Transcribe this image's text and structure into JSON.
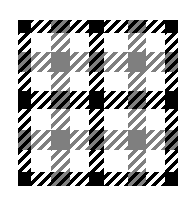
{
  "image": {
    "description": "Black, gray and white gingham / tartan check pattern square with diagonal hatched stripes",
    "colors": {
      "black": "#000000",
      "gray": "#7f7f7f",
      "white": "#ffffff",
      "background": "#ffffff"
    },
    "pattern": {
      "origin": [
        18,
        20
      ],
      "size": [
        160,
        166
      ],
      "stripe_direction": "diagonal-45deg-rising",
      "stripe_period_px": 7,
      "columns": [
        {
          "band": "black",
          "start": 0,
          "width": 13
        },
        {
          "band": "white",
          "start": 13,
          "width": 20
        },
        {
          "band": "gray",
          "start": 33,
          "width": 19
        },
        {
          "band": "white",
          "start": 52,
          "width": 19
        },
        {
          "band": "black",
          "start": 71,
          "width": 15
        },
        {
          "band": "white",
          "start": 86,
          "width": 24
        },
        {
          "band": "gray",
          "start": 110,
          "width": 18
        },
        {
          "band": "white",
          "start": 128,
          "width": 19
        },
        {
          "band": "black",
          "start": 147,
          "width": 13
        }
      ],
      "rows": [
        {
          "band": "black",
          "start": 0,
          "height": 13
        },
        {
          "band": "white",
          "start": 13,
          "height": 19
        },
        {
          "band": "gray",
          "start": 32,
          "height": 20
        },
        {
          "band": "white",
          "start": 52,
          "height": 19
        },
        {
          "band": "black",
          "start": 71,
          "height": 18
        },
        {
          "band": "white",
          "start": 89,
          "height": 21
        },
        {
          "band": "gray",
          "start": 110,
          "height": 20
        },
        {
          "band": "white",
          "start": 130,
          "height": 22
        },
        {
          "band": "black",
          "start": 152,
          "height": 14
        }
      ]
    }
  }
}
